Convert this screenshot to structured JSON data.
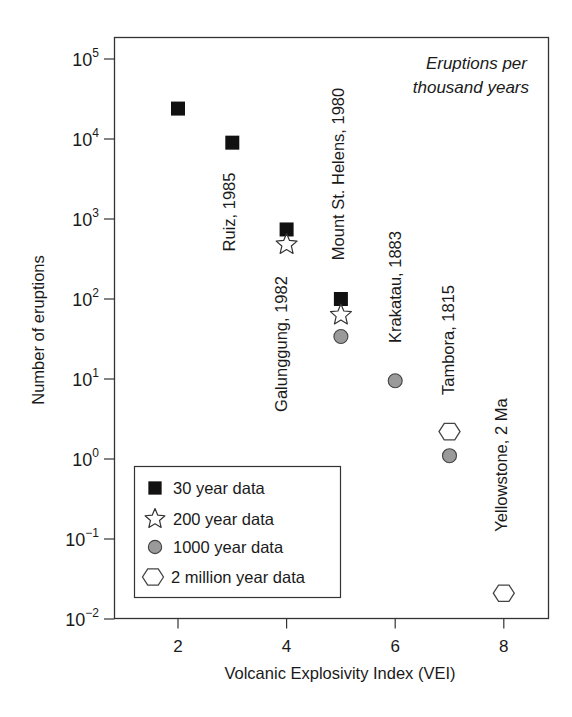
{
  "chart_data": {
    "type": "scatter",
    "title": "",
    "annotation": [
      "Eruptions per",
      "thousand years"
    ],
    "xlabel": "Volcanic Explosivity Index (VEI)",
    "ylabel": "Number of eruptions",
    "xscale": "linear",
    "yscale": "log",
    "xlim": [
      0.8,
      8.8
    ],
    "ylim": [
      0.01,
      100000
    ],
    "xticks": [
      2,
      4,
      6,
      8
    ],
    "yticks": [
      {
        "base": "10",
        "exp": "5",
        "value": 100000
      },
      {
        "base": "10",
        "exp": "4",
        "value": 10000
      },
      {
        "base": "10",
        "exp": "3",
        "value": 1000
      },
      {
        "base": "10",
        "exp": "2",
        "value": 100
      },
      {
        "base": "10",
        "exp": "1",
        "value": 10
      },
      {
        "base": "10",
        "exp": "0",
        "value": 1
      },
      {
        "base": "10",
        "exp": "−1",
        "value": 0.1
      },
      {
        "base": "10",
        "exp": "−2",
        "value": 0.01
      }
    ],
    "grid": false,
    "legend_position": "lower-left",
    "series": [
      {
        "name": "30 year data",
        "marker": "square",
        "color": "#111111",
        "points": [
          {
            "x": 2,
            "y": 24000
          },
          {
            "x": 3,
            "y": 9000
          },
          {
            "x": 4,
            "y": 740
          },
          {
            "x": 5,
            "y": 100
          }
        ]
      },
      {
        "name": "200 year data",
        "marker": "star",
        "color": "#ffffff",
        "points": [
          {
            "x": 4,
            "y": 480
          },
          {
            "x": 5,
            "y": 63
          }
        ]
      },
      {
        "name": "1000 year data",
        "marker": "circle",
        "color": "#9a9a9a",
        "points": [
          {
            "x": 5,
            "y": 34
          },
          {
            "x": 6,
            "y": 9.5
          },
          {
            "x": 7,
            "y": 1.1
          }
        ]
      },
      {
        "name": "2 million year data",
        "marker": "hexagon",
        "color": "#ffffff",
        "points": [
          {
            "x": 7,
            "y": 2.2
          },
          {
            "x": 8,
            "y": 0.021
          }
        ]
      }
    ],
    "point_labels": [
      {
        "text": "Ruiz, 1985",
        "x": 3,
        "cx": 231,
        "cy": 212
      },
      {
        "text": "Galunggung, 1982",
        "x": 4,
        "cx": 283,
        "cy": 344
      },
      {
        "text": "Mount St. Helens, 1980",
        "x": 5,
        "cx": 340,
        "cy": 174
      },
      {
        "text": "Krakatau, 1883",
        "x": 6,
        "cx": 397,
        "cy": 287
      },
      {
        "text": "Tambora, 1815",
        "x": 7,
        "cx": 450,
        "cy": 340
      },
      {
        "text": "Yellowstone, 2 Ma",
        "x": 8,
        "cx": 503,
        "cy": 465
      }
    ]
  }
}
